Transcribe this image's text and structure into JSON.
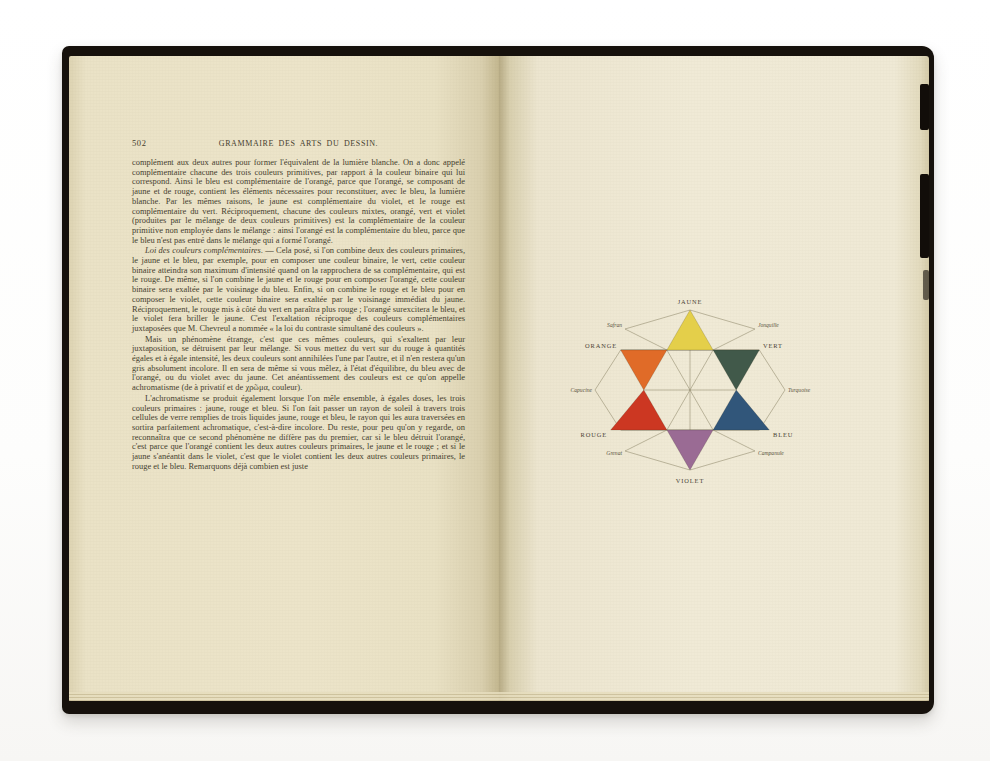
{
  "left_page": {
    "folio": "502",
    "running_title": "GRAMMAIRE DES ARTS DU DESSIN.",
    "paragraphs": {
      "p1": "complément aux deux autres pour former l'équivalent de la lumière blanche. On a donc appelé complémentaire chacune des trois couleurs primitives, par rapport à la couleur binaire qui lui correspond. Ainsi le bleu est complémentaire de l'orangé, parce que l'orangé, se composant de jaune et de rouge, contient les éléments nécessaires pour reconstituer, avec le bleu, la lumière blanche. Par les mêmes raisons, le jaune est complémentaire du violet, et le rouge est complémentaire du vert. Réciproquement, chacune des couleurs mixtes, orangé, vert et violet (produites par le mélange de deux couleurs primitives) est la complémentaire de la couleur primitive non employée dans le mélange : ainsi l'orangé est la complémentaire du bleu, parce que le bleu n'est pas entré dans le mélange qui a formé l'orangé.",
      "p2_lead": "Loi des couleurs complémentaires.",
      "p2_rest": " — Cela posé, si l'on combine deux des couleurs primaires, le jaune et le bleu, par exemple, pour en composer une couleur binaire, le vert, cette couleur binaire atteindra son maximum d'intensité quand on la rapprochera de sa complémentaire, qui est le rouge. De même, si l'on combine le jaune et le rouge pour en composer l'orangé, cette couleur binaire sera exaltée par le voisinage du bleu. Enfin, si on combine le rouge et le bleu pour en composer le violet, cette couleur binaire sera exaltée par le voisinage immédiat du jaune. Réciproquement, le rouge mis à côté du vert en paraîtra plus rouge ; l'orangé surexcitera le bleu, et le violet fera briller le jaune. C'est l'exaltation réciproque des couleurs complémentaires juxtaposées que M. Chevreul a nommée « la loi du contraste simultané des couleurs ».",
      "p3": "Mais un phénomène étrange, c'est que ces mêmes couleurs, qui s'exaltent par leur juxtaposition, se détruisent par leur mélange. Si vous mettez du vert sur du rouge à quantités égales et à égale intensité, les deux couleurs sont annihilées l'une par l'autre, et il n'en restera qu'un gris absolument incolore. Il en sera de même si vous mêlez, à l'état d'équilibre, du bleu avec de l'orangé, ou du violet avec du jaune. Cet anéantissement des couleurs est ce qu'on appelle achromatisme (de à privatif et de χρῶμα, couleur).",
      "p4": "L'achromatisme se produit également lorsque l'on mêle ensemble, à égales doses, les trois couleurs primaires : jaune, rouge et bleu. Si l'on fait passer un rayon de soleil à travers trois cellules de verre remplies de trois liquides jaune, rouge et bleu, le rayon qui les aura traversées en sortira parfaitement achromatique, c'est-à-dire incolore. Du reste, pour peu qu'on y regarde, on reconnaîtra que ce second phénomène ne diffère pas du premier, car si le bleu détruit l'orangé, c'est parce que l'orangé contient les deux autres couleurs primaires, le jaune et le rouge ; et si le jaune s'anéantit dans le violet, c'est que le violet contient les deux autres couleurs primaires, le rouge et le bleu. Remarquons déjà combien est juste"
    }
  },
  "right_page": {
    "diagram": {
      "type": "color-star",
      "primaries": {
        "jaune": {
          "label": "JAUNE",
          "color": "#e4cf4a"
        },
        "orange": {
          "label": "ORANGE",
          "color": "#e06b28"
        },
        "vert": {
          "label": "VERT",
          "color": "#41594a"
        },
        "rouge": {
          "label": "ROUGE",
          "color": "#cc3722"
        },
        "bleu": {
          "label": "BLEU",
          "color": "#31567a"
        },
        "violet": {
          "label": "VIOLET",
          "color": "#9a6b94"
        }
      },
      "tertiaries": {
        "safran": "Safran",
        "jonquille": "Jonquille",
        "capucine": "Capucine",
        "turquoise": "Turquoise",
        "grenat": "Grenat",
        "campanule": "Campanule"
      }
    }
  }
}
